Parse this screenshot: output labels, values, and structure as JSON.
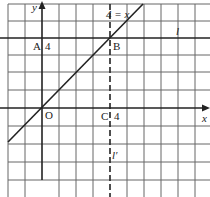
{
  "diagram": {
    "type": "coordinate-grid",
    "axes": {
      "x_label": "x",
      "y_label": "y",
      "origin_label": "O"
    },
    "lines": [
      {
        "name": "l",
        "label": "l",
        "description": "horizontal line y = 4",
        "style": "solid"
      },
      {
        "name": "l-prime",
        "label": "l′",
        "description": "vertical line x = 4",
        "style": "dashed"
      },
      {
        "name": "diagonal",
        "label": "4 = x",
        "description": "line y = x",
        "style": "solid"
      }
    ],
    "points": [
      {
        "name": "A",
        "label": "A",
        "value_label": "4"
      },
      {
        "name": "B",
        "label": "B"
      },
      {
        "name": "C",
        "label": "C",
        "value_label": "4"
      }
    ]
  },
  "colors": {
    "grid": "#555555",
    "axis": "#222222",
    "line": "#222222"
  }
}
